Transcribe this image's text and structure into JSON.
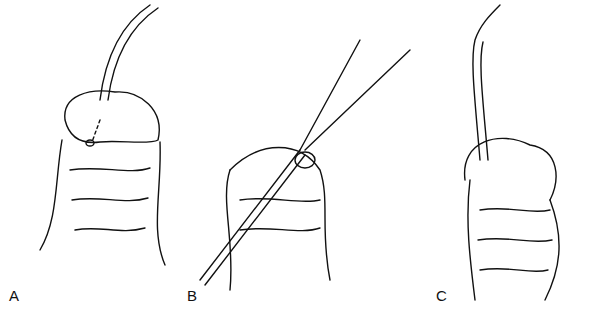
{
  "figure": {
    "panels": [
      {
        "label": "A",
        "x": 9,
        "y": 287
      },
      {
        "label": "B",
        "x": 187,
        "y": 287
      },
      {
        "label": "C",
        "x": 436,
        "y": 287
      }
    ]
  }
}
